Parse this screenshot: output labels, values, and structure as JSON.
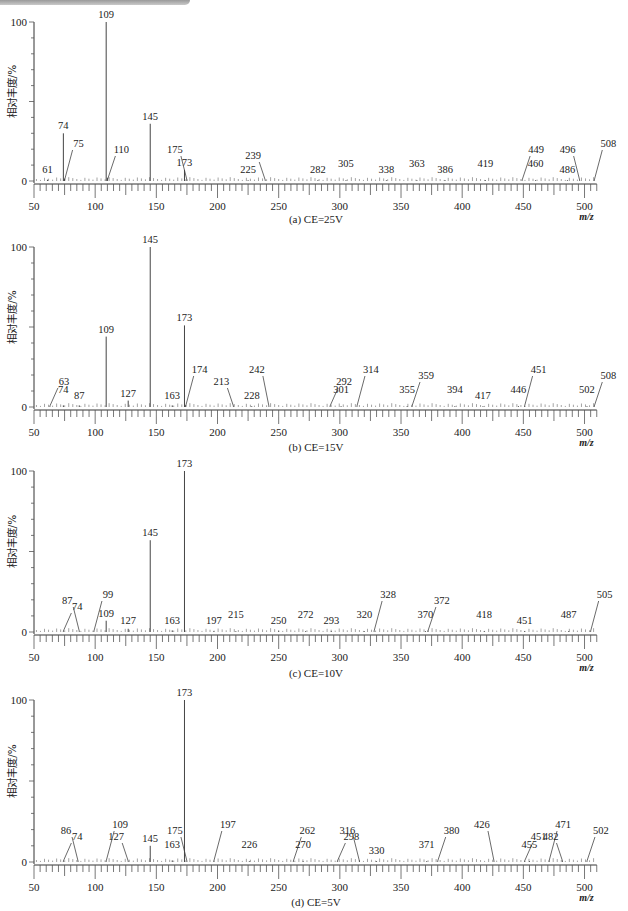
{
  "figure": {
    "header_bar": ""
  },
  "chart_data": [
    {
      "type": "bar",
      "subtype": "mass-spectrum",
      "caption": "(a) CE=25V",
      "xlabel": "m/z",
      "ylabel": "相对丰度/%",
      "xlim": [
        50,
        510
      ],
      "ylim": [
        0,
        100
      ],
      "xticks": [
        50,
        100,
        150,
        200,
        250,
        300,
        350,
        400,
        450,
        500
      ],
      "yticks": [
        0,
        100
      ],
      "grid": false,
      "peaks": [
        {
          "mz": 61,
          "intensity": 0.8,
          "label": "61"
        },
        {
          "mz": 74,
          "intensity": 30,
          "label": "74"
        },
        {
          "mz": 75,
          "intensity": 1.5,
          "label": "75",
          "leader": true
        },
        {
          "mz": 109,
          "intensity": 100,
          "label": "109"
        },
        {
          "mz": 110,
          "intensity": 2,
          "label": "110",
          "leader": true
        },
        {
          "mz": 145,
          "intensity": 36,
          "label": "145"
        },
        {
          "mz": 173,
          "intensity": 7,
          "label": "173"
        },
        {
          "mz": 175,
          "intensity": 0.8,
          "label": "175",
          "leader": true
        },
        {
          "mz": 225,
          "intensity": 0.5,
          "label": "225"
        },
        {
          "mz": 239,
          "intensity": 0.5,
          "label": "239",
          "leader": true
        },
        {
          "mz": 282,
          "intensity": 0.5,
          "label": "282"
        },
        {
          "mz": 305,
          "intensity": 0.5,
          "label": "305"
        },
        {
          "mz": 338,
          "intensity": 0.5,
          "label": "338"
        },
        {
          "mz": 363,
          "intensity": 0.5,
          "label": "363"
        },
        {
          "mz": 386,
          "intensity": 0.5,
          "label": "386"
        },
        {
          "mz": 419,
          "intensity": 0.5,
          "label": "419"
        },
        {
          "mz": 449,
          "intensity": 0.5,
          "label": "449",
          "leader": true
        },
        {
          "mz": 460,
          "intensity": 0.5,
          "label": "460"
        },
        {
          "mz": 486,
          "intensity": 0.5,
          "label": "486"
        },
        {
          "mz": 496,
          "intensity": 0.5,
          "label": "496",
          "leader": true
        },
        {
          "mz": 508,
          "intensity": 0.5,
          "label": "508",
          "leader": true
        }
      ]
    },
    {
      "type": "bar",
      "subtype": "mass-spectrum",
      "caption": "(b) CE=15V",
      "xlabel": "m/z",
      "ylabel": "相对丰度/%",
      "xlim": [
        50,
        510
      ],
      "ylim": [
        0,
        100
      ],
      "xticks": [
        50,
        100,
        150,
        200,
        250,
        300,
        350,
        400,
        450,
        500
      ],
      "yticks": [
        0,
        100
      ],
      "grid": false,
      "peaks": [
        {
          "mz": 63,
          "intensity": 0.5,
          "label": "63",
          "leader": true
        },
        {
          "mz": 74,
          "intensity": 1,
          "label": "74"
        },
        {
          "mz": 87,
          "intensity": 1,
          "label": "87"
        },
        {
          "mz": 109,
          "intensity": 44,
          "label": "109"
        },
        {
          "mz": 127,
          "intensity": 4,
          "label": "127"
        },
        {
          "mz": 145,
          "intensity": 100,
          "label": "145"
        },
        {
          "mz": 163,
          "intensity": 1,
          "label": "163"
        },
        {
          "mz": 173,
          "intensity": 51,
          "label": "173"
        },
        {
          "mz": 174,
          "intensity": 1,
          "label": "174",
          "leader": true
        },
        {
          "mz": 213,
          "intensity": 0.5,
          "label": "213",
          "leader": true
        },
        {
          "mz": 228,
          "intensity": 0.5,
          "label": "228"
        },
        {
          "mz": 242,
          "intensity": 0.5,
          "label": "242",
          "leader": true
        },
        {
          "mz": 292,
          "intensity": 0.5,
          "label": "292",
          "leader": true
        },
        {
          "mz": 301,
          "intensity": 0.5,
          "label": "301"
        },
        {
          "mz": 314,
          "intensity": 0.5,
          "label": "314",
          "leader": true
        },
        {
          "mz": 355,
          "intensity": 0.5,
          "label": "355"
        },
        {
          "mz": 359,
          "intensity": 0.5,
          "label": "359",
          "leader": true
        },
        {
          "mz": 394,
          "intensity": 0.5,
          "label": "394"
        },
        {
          "mz": 417,
          "intensity": 0.5,
          "label": "417"
        },
        {
          "mz": 446,
          "intensity": 0.5,
          "label": "446"
        },
        {
          "mz": 451,
          "intensity": 0.5,
          "label": "451",
          "leader": true
        },
        {
          "mz": 502,
          "intensity": 0.5,
          "label": "502"
        },
        {
          "mz": 508,
          "intensity": 0.5,
          "label": "508",
          "leader": true
        }
      ]
    },
    {
      "type": "bar",
      "subtype": "mass-spectrum",
      "caption": "(c) CE=10V",
      "xlabel": "m/z",
      "ylabel": "相对丰度/%",
      "xlim": [
        50,
        510
      ],
      "ylim": [
        0,
        100
      ],
      "xticks": [
        50,
        100,
        150,
        200,
        250,
        300,
        350,
        400,
        450,
        500
      ],
      "yticks": [
        0,
        100
      ],
      "grid": false,
      "peaks": [
        {
          "mz": 74,
          "intensity": 0.5,
          "label": "74",
          "leader": true
        },
        {
          "mz": 87,
          "intensity": 0.5,
          "label": "87",
          "leader": true
        },
        {
          "mz": 99,
          "intensity": 0.5,
          "label": "99",
          "leader": true
        },
        {
          "mz": 109,
          "intensity": 7,
          "label": "109"
        },
        {
          "mz": 127,
          "intensity": 2,
          "label": "127"
        },
        {
          "mz": 145,
          "intensity": 57,
          "label": "145"
        },
        {
          "mz": 163,
          "intensity": 1,
          "label": "163"
        },
        {
          "mz": 173,
          "intensity": 100,
          "label": "173"
        },
        {
          "mz": 197,
          "intensity": 0.5,
          "label": "197"
        },
        {
          "mz": 215,
          "intensity": 0.5,
          "label": "215"
        },
        {
          "mz": 250,
          "intensity": 0.5,
          "label": "250"
        },
        {
          "mz": 272,
          "intensity": 0.5,
          "label": "272"
        },
        {
          "mz": 293,
          "intensity": 0.5,
          "label": "293"
        },
        {
          "mz": 320,
          "intensity": 0.5,
          "label": "320"
        },
        {
          "mz": 328,
          "intensity": 0.5,
          "label": "328",
          "leader": true
        },
        {
          "mz": 370,
          "intensity": 0.5,
          "label": "370"
        },
        {
          "mz": 372,
          "intensity": 0.5,
          "label": "372",
          "leader": true
        },
        {
          "mz": 418,
          "intensity": 0.5,
          "label": "418"
        },
        {
          "mz": 451,
          "intensity": 0.5,
          "label": "451"
        },
        {
          "mz": 487,
          "intensity": 0.5,
          "label": "487"
        },
        {
          "mz": 505,
          "intensity": 0.5,
          "label": "505",
          "leader": true
        }
      ]
    },
    {
      "type": "bar",
      "subtype": "mass-spectrum",
      "caption": "(d) CE=5V",
      "xlabel": "m/z",
      "ylabel": "相对丰度/%",
      "xlim": [
        50,
        510
      ],
      "ylim": [
        0,
        100
      ],
      "xticks": [
        50,
        100,
        150,
        200,
        250,
        300,
        350,
        400,
        450,
        500
      ],
      "yticks": [
        0,
        100
      ],
      "grid": false,
      "peaks": [
        {
          "mz": 74,
          "intensity": 0.5,
          "label": "74",
          "leader": true
        },
        {
          "mz": 86,
          "intensity": 0.5,
          "label": "86",
          "leader": true
        },
        {
          "mz": 109,
          "intensity": 0.5,
          "label": "109",
          "leader": true
        },
        {
          "mz": 127,
          "intensity": 0.5,
          "label": "127",
          "leader": true
        },
        {
          "mz": 145,
          "intensity": 10,
          "label": "145"
        },
        {
          "mz": 163,
          "intensity": 1,
          "label": "163"
        },
        {
          "mz": 173,
          "intensity": 100,
          "label": "173"
        },
        {
          "mz": 175,
          "intensity": 0.5,
          "label": "175",
          "leader": true
        },
        {
          "mz": 197,
          "intensity": 0.5,
          "label": "197",
          "leader": true
        },
        {
          "mz": 226,
          "intensity": 0.5,
          "label": "226"
        },
        {
          "mz": 262,
          "intensity": 0.5,
          "label": "262",
          "leader": true
        },
        {
          "mz": 270,
          "intensity": 0.5,
          "label": "270"
        },
        {
          "mz": 298,
          "intensity": 0.5,
          "label": "298",
          "leader": true
        },
        {
          "mz": 316,
          "intensity": 0.5,
          "label": "316",
          "leader": true
        },
        {
          "mz": 330,
          "intensity": 0.5,
          "label": "330"
        },
        {
          "mz": 371,
          "intensity": 0.5,
          "label": "371"
        },
        {
          "mz": 380,
          "intensity": 0.5,
          "label": "380",
          "leader": true
        },
        {
          "mz": 426,
          "intensity": 0.5,
          "label": "426",
          "leader": true
        },
        {
          "mz": 451,
          "intensity": 0.5,
          "label": "451",
          "leader": true
        },
        {
          "mz": 455,
          "intensity": 0.5,
          "label": "455"
        },
        {
          "mz": 471,
          "intensity": 0.5,
          "label": "471",
          "leader": true
        },
        {
          "mz": 482,
          "intensity": 0.5,
          "label": "482",
          "leader": true
        },
        {
          "mz": 502,
          "intensity": 0.5,
          "label": "502",
          "leader": true
        }
      ]
    }
  ]
}
